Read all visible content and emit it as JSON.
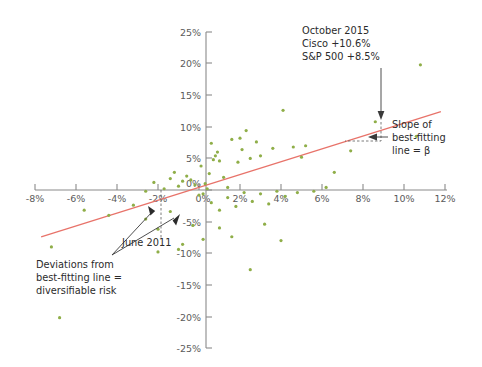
{
  "chart_data": {
    "type": "scatter",
    "title": "",
    "xlabel": "",
    "ylabel": "",
    "xlim": [
      -9,
      13
    ],
    "ylim": [
      -27,
      27
    ],
    "grid": false,
    "legend": "none",
    "point_color": "#8fae48",
    "fitline_color": "#e8736a",
    "xticks": [
      "-8%",
      "-6%",
      "-4%",
      "-2%",
      "0%",
      "2%",
      "4%",
      "6%",
      "8%",
      "10%",
      "12%"
    ],
    "xtick_values": [
      -8,
      -6,
      -4,
      -2,
      0,
      2,
      4,
      6,
      8,
      10,
      12
    ],
    "yticks": [
      "25%",
      "20%",
      "15%",
      "10%",
      "5%",
      "0%",
      "-5%",
      "-10%",
      "-15%",
      "-20%",
      "-25%"
    ],
    "ytick_values": [
      25,
      20,
      15,
      10,
      5,
      0,
      -5,
      -10,
      -15,
      -20,
      -25
    ],
    "fit_line": {
      "x0": -7.7,
      "y0": -7.4,
      "x1": 11.8,
      "y1": 12.4,
      "slope_label": "beta"
    },
    "points": [
      {
        "x": 10.6,
        "y": 8.5,
        "label": "October 2015"
      },
      {
        "x": -2.0,
        "y": -6.2,
        "label": "June 2011"
      },
      {
        "x": 10.8,
        "y": 19.8
      },
      {
        "x": 8.6,
        "y": 10.8
      },
      {
        "x": 5.2,
        "y": 7.0
      },
      {
        "x": 5.0,
        "y": 5.2
      },
      {
        "x": 4.6,
        "y": 6.8
      },
      {
        "x": 4.1,
        "y": 12.6
      },
      {
        "x": 3.6,
        "y": 6.6
      },
      {
        "x": 3.0,
        "y": 5.4
      },
      {
        "x": 2.8,
        "y": 7.6
      },
      {
        "x": 2.5,
        "y": 5.0
      },
      {
        "x": 2.3,
        "y": 9.4
      },
      {
        "x": 2.1,
        "y": 6.4
      },
      {
        "x": 2.0,
        "y": 8.2
      },
      {
        "x": 1.9,
        "y": 4.4
      },
      {
        "x": 1.6,
        "y": 8.0
      },
      {
        "x": 1.4,
        "y": 0.4
      },
      {
        "x": 1.2,
        "y": 2.0
      },
      {
        "x": 1.0,
        "y": 4.6
      },
      {
        "x": 0.9,
        "y": 6.0
      },
      {
        "x": 0.8,
        "y": 5.4
      },
      {
        "x": 0.7,
        "y": 4.8
      },
      {
        "x": 0.6,
        "y": 7.4
      },
      {
        "x": 0.5,
        "y": 2.6
      },
      {
        "x": 0.4,
        "y": 0.2
      },
      {
        "x": 0.3,
        "y": 1.0
      },
      {
        "x": 0.2,
        "y": -0.6
      },
      {
        "x": 0.1,
        "y": 3.8
      },
      {
        "x": -0.2,
        "y": 0.8
      },
      {
        "x": -0.4,
        "y": 1.6
      },
      {
        "x": -0.6,
        "y": 2.2
      },
      {
        "x": -0.8,
        "y": 1.4
      },
      {
        "x": -1.0,
        "y": 0.6
      },
      {
        "x": -1.2,
        "y": 2.8
      },
      {
        "x": -1.4,
        "y": 1.8
      },
      {
        "x": -1.7,
        "y": 0.2
      },
      {
        "x": -2.2,
        "y": 1.2
      },
      {
        "x": -2.6,
        "y": -0.2
      },
      {
        "x": 0.0,
        "y": -0.8
      },
      {
        "x": 0.6,
        "y": -2.0
      },
      {
        "x": 1.0,
        "y": -3.2
      },
      {
        "x": 1.4,
        "y": -1.2
      },
      {
        "x": 1.8,
        "y": -2.6
      },
      {
        "x": 2.2,
        "y": -0.4
      },
      {
        "x": 2.6,
        "y": -1.8
      },
      {
        "x": 3.0,
        "y": -0.6
      },
      {
        "x": 3.4,
        "y": -2.2
      },
      {
        "x": 3.8,
        "y": -0.2
      },
      {
        "x": 4.2,
        "y": -1.0
      },
      {
        "x": 4.8,
        "y": -0.4
      },
      {
        "x": 5.6,
        "y": -0.2
      },
      {
        "x": 6.2,
        "y": 0.4
      },
      {
        "x": 2.5,
        "y": -12.6
      },
      {
        "x": 1.6,
        "y": -7.4
      },
      {
        "x": -0.3,
        "y": -5.6
      },
      {
        "x": -1.4,
        "y": -3.4
      },
      {
        "x": -2.6,
        "y": -4.6
      },
      {
        "x": -3.2,
        "y": -2.4
      },
      {
        "x": -4.4,
        "y": -4.0
      },
      {
        "x": -5.6,
        "y": -3.2
      },
      {
        "x": -6.8,
        "y": -20.2
      },
      {
        "x": -7.2,
        "y": -9.0
      },
      {
        "x": -2.0,
        "y": -9.8
      },
      {
        "x": -1.0,
        "y": -9.4
      },
      {
        "x": 1.0,
        "y": -6.0
      },
      {
        "x": 0.2,
        "y": -7.8
      },
      {
        "x": -0.8,
        "y": -8.6
      },
      {
        "x": 3.2,
        "y": -5.4
      },
      {
        "x": 4.0,
        "y": -8.0
      },
      {
        "x": 6.6,
        "y": 2.8
      },
      {
        "x": 7.4,
        "y": 6.2
      }
    ]
  },
  "annotations": {
    "october": {
      "line1": "October 2015",
      "line2": "Cisco +10.6%",
      "line3": "S&P 500 +8.5%"
    },
    "slope": {
      "line1": "Slope of",
      "line2": "best-fitting",
      "line3": "line = β"
    },
    "deviations": {
      "line1": "Deviations from",
      "line2": "best-fitting line =",
      "line3": "diversifiable risk"
    },
    "june": {
      "label": "June 2011"
    }
  }
}
